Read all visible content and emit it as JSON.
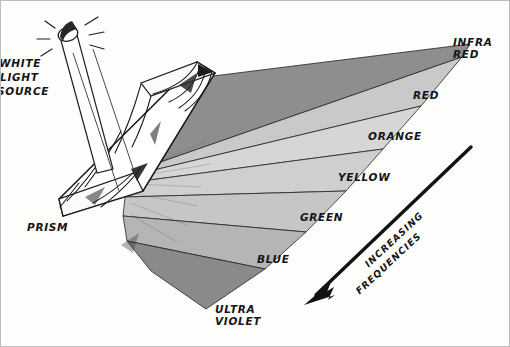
{
  "figure": {
    "background_color": "#fdfdfc",
    "ink_color": "#151515",
    "border_color": "#bdbdbd"
  },
  "source": {
    "line1": "WHITE",
    "line2": "LIGHT",
    "line3": "SOURCE",
    "lamp_icon": "lamp-icon",
    "spark_icon": "spark-lines-icon",
    "beam_icon": "light-beam-icon"
  },
  "prism": {
    "label": "PRISM",
    "icon": "prism-icon"
  },
  "spectrum": {
    "bands": [
      {
        "name": "INFRA\nRED",
        "key": "infrared",
        "fill": "#8e8e8e"
      },
      {
        "name": "RED",
        "key": "red",
        "fill": "#c9c9c9"
      },
      {
        "name": "ORANGE",
        "key": "orange",
        "fill": "#d6d6d6"
      },
      {
        "name": "YELLOW",
        "key": "yellow",
        "fill": "#cfcfcf"
      },
      {
        "name": "GREEN",
        "key": "green",
        "fill": "#c6c6c6"
      },
      {
        "name": "BLUE",
        "key": "blue",
        "fill": "#b5b5b5"
      },
      {
        "name": "ULTRA\nVIOLET",
        "key": "ultraviolet",
        "fill": "#8a8a8a"
      }
    ],
    "labels": {
      "infrared_l1": "INFRA",
      "infrared_l2": "RED",
      "red": "RED",
      "orange": "ORANGE",
      "yellow": "YELLOW",
      "green": "GREEN",
      "blue": "BLUE",
      "ultraviolet_l1": "ULTRA",
      "ultraviolet_l2": "VIOLET"
    }
  },
  "arrow": {
    "line1": "INCREASING",
    "line2": "FREQUENCIES",
    "direction": "down-left",
    "icon": "arrow-down-left-icon",
    "color": "#121212"
  }
}
